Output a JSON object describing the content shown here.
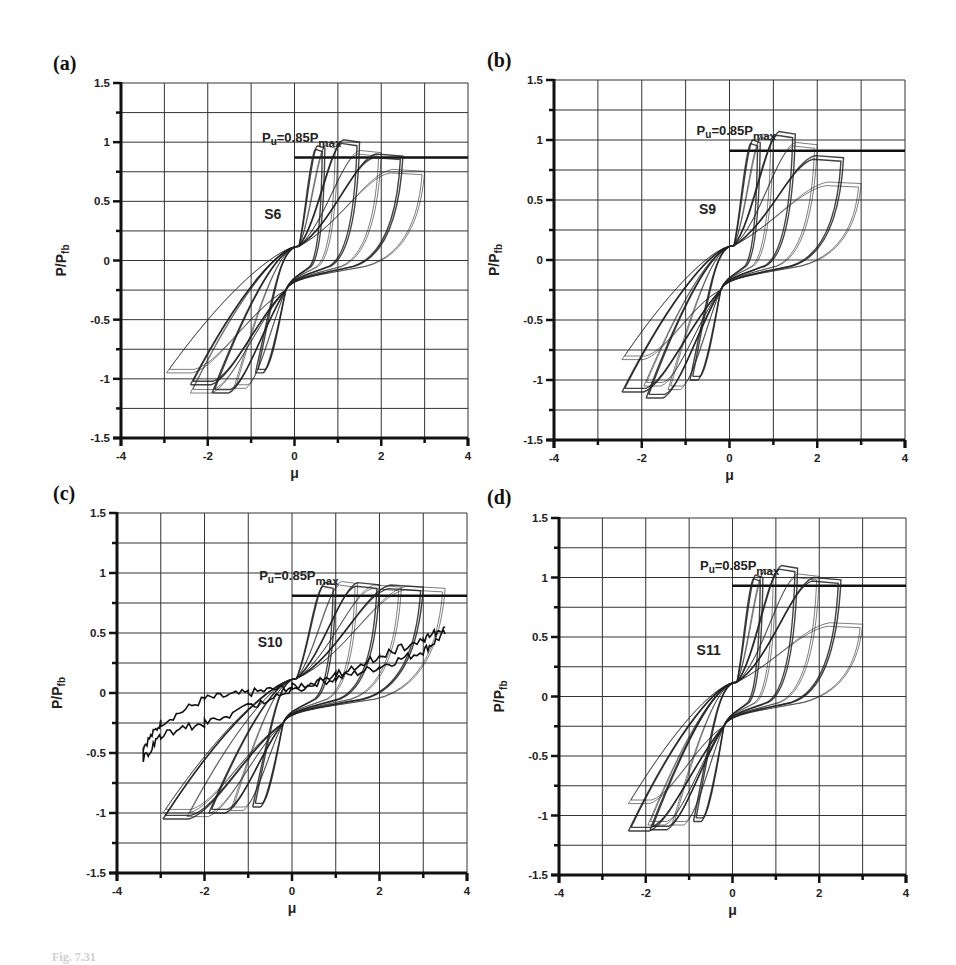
{
  "figure": {
    "caption_fragment": "Fig. 7.31",
    "background": "#ffffff",
    "line_color": "#222222"
  },
  "panels": [
    {
      "letter": "(a)",
      "specimen": "S6",
      "ylabel": "P/Pfb",
      "xlabel": "μ",
      "threshold_label": "Pu=0.85Pmax"
    },
    {
      "letter": "(b)",
      "specimen": "S9",
      "ylabel": "P/Pfb",
      "xlabel": "μ",
      "threshold_label": "Pu=0.85Pmax"
    },
    {
      "letter": "(c)",
      "specimen": "S10",
      "ylabel": "P/Pfb",
      "xlabel": "μ",
      "threshold_label": "Pu=0.85Pmax"
    },
    {
      "letter": "(d)",
      "specimen": "S11",
      "ylabel": "P/Pfb",
      "xlabel": "μ",
      "threshold_label": "Pu=0.85Pmax"
    }
  ],
  "chart_data": [
    {
      "type": "line",
      "title": "(a) S6",
      "xlabel": "μ",
      "ylabel": "P/Pfb",
      "xlim": [
        -4,
        4
      ],
      "ylim": [
        -1.5,
        1.5
      ],
      "x_ticks": [
        -4,
        -2,
        0,
        2,
        4
      ],
      "y_ticks": [
        -1.5,
        -1,
        -0.5,
        0,
        0.5,
        1,
        1.5
      ],
      "grid": true,
      "frame_px": {
        "left": 121,
        "top": 83,
        "right": 468,
        "bottom": 438
      },
      "annotations": [
        {
          "text": "Pu=0.85Pmax",
          "type": "threshold_line",
          "y": 0.87,
          "x_from": 0,
          "x_to": 4
        },
        {
          "text": "S6",
          "x": -0.5,
          "y": 0.35
        }
      ],
      "series": [
        {
          "name": "hysteresis loops",
          "cycles": [
            {
              "mu_pos": 0.7,
              "p_pos": 0.97,
              "mu_neg": -0.9,
              "p_neg": -0.95
            },
            {
              "mu_pos": 1.0,
              "p_pos": 1.0,
              "mu_neg": -1.4,
              "p_neg": -1.08
            },
            {
              "mu_pos": 1.5,
              "p_pos": 1.02,
              "mu_neg": -1.9,
              "p_neg": -1.12
            },
            {
              "mu_pos": 2.0,
              "p_pos": 0.93,
              "mu_neg": -2.4,
              "p_neg": -1.12
            },
            {
              "mu_pos": 2.5,
              "p_pos": 0.9,
              "mu_neg": -2.4,
              "p_neg": -1.05
            },
            {
              "mu_pos": 3.0,
              "p_pos": 0.77,
              "mu_neg": -2.95,
              "p_neg": -0.95
            }
          ]
        }
      ]
    },
    {
      "type": "line",
      "title": "(b) S9",
      "xlabel": "μ",
      "ylabel": "P/Pfb",
      "xlim": [
        -4,
        4
      ],
      "ylim": [
        -1.5,
        1.5
      ],
      "x_ticks": [
        -4,
        -2,
        0,
        2,
        4
      ],
      "y_ticks": [
        -1.5,
        -1,
        -0.5,
        0,
        0.5,
        1,
        1.5
      ],
      "grid": true,
      "frame_px": {
        "left": 554,
        "top": 80,
        "right": 905,
        "bottom": 440
      },
      "annotations": [
        {
          "text": "Pu=0.85Pmax",
          "type": "threshold_line",
          "y": 0.91,
          "x_from": 0,
          "x_to": 4
        },
        {
          "text": "S9",
          "x": -0.5,
          "y": 0.38
        }
      ],
      "series": [
        {
          "name": "hysteresis loops",
          "cycles": [
            {
              "mu_pos": 0.7,
              "p_pos": 1.0,
              "mu_neg": -0.9,
              "p_neg": -1.0
            },
            {
              "mu_pos": 1.0,
              "p_pos": 1.05,
              "mu_neg": -1.4,
              "p_neg": -1.08
            },
            {
              "mu_pos": 1.5,
              "p_pos": 1.07,
              "mu_neg": -1.9,
              "p_neg": -1.15
            },
            {
              "mu_pos": 2.0,
              "p_pos": 0.98,
              "mu_neg": -1.95,
              "p_neg": -1.05
            },
            {
              "mu_pos": 2.6,
              "p_pos": 0.87,
              "mu_neg": -2.45,
              "p_neg": -1.1
            },
            {
              "mu_pos": 3.0,
              "p_pos": 0.65,
              "mu_neg": -2.45,
              "p_neg": -0.83
            }
          ]
        }
      ]
    },
    {
      "type": "line",
      "title": "(c) S10",
      "xlabel": "μ",
      "ylabel": "P/Pfb",
      "xlim": [
        -4,
        4
      ],
      "ylim": [
        -1.5,
        1.5
      ],
      "x_ticks": [
        -4,
        -2,
        0,
        2,
        4
      ],
      "y_ticks": [
        -1.5,
        -1,
        -0.5,
        0,
        0.5,
        1,
        1.5
      ],
      "grid": true,
      "frame_px": {
        "left": 117,
        "top": 513,
        "right": 467,
        "bottom": 873
      },
      "annotations": [
        {
          "text": "Pu=0.85Pmax",
          "type": "threshold_line",
          "y": 0.81,
          "x_from": 0,
          "x_to": 4
        },
        {
          "text": "S10",
          "x": -0.5,
          "y": 0.38
        }
      ],
      "series": [
        {
          "name": "hysteresis loops",
          "cycles": [
            {
              "mu_pos": 1.0,
              "p_pos": 0.92,
              "mu_neg": -0.9,
              "p_neg": -0.95
            },
            {
              "mu_pos": 1.5,
              "p_pos": 0.93,
              "mu_neg": -1.4,
              "p_neg": -0.98
            },
            {
              "mu_pos": 2.0,
              "p_pos": 0.92,
              "mu_neg": -1.9,
              "p_neg": -1.0
            },
            {
              "mu_pos": 2.5,
              "p_pos": 0.9,
              "mu_neg": -2.4,
              "p_neg": -1.03
            },
            {
              "mu_pos": 3.0,
              "p_pos": 0.9,
              "mu_neg": -2.95,
              "p_neg": -1.05
            },
            {
              "mu_pos": 3.5,
              "p_pos": 0.89,
              "mu_neg": -2.95,
              "p_neg": -1.0
            }
          ]
        },
        {
          "name": "final degraded cycle (noisy)",
          "points": [
            [
              3.5,
              0.55
            ],
            [
              3.0,
              0.45
            ],
            [
              2.0,
              0.3
            ],
            [
              1.0,
              0.15
            ],
            [
              0.0,
              0.02
            ],
            [
              -1.0,
              -0.12
            ],
            [
              -2.0,
              -0.25
            ],
            [
              -3.0,
              -0.35
            ],
            [
              -3.4,
              -0.55
            ],
            [
              -3.4,
              -0.45
            ],
            [
              -3.0,
              -0.25
            ],
            [
              -2.0,
              -0.05
            ],
            [
              -1.0,
              0.0
            ],
            [
              0.0,
              0.05
            ],
            [
              1.0,
              0.12
            ],
            [
              2.0,
              0.22
            ],
            [
              3.0,
              0.35
            ],
            [
              3.5,
              0.5
            ]
          ]
        }
      ]
    },
    {
      "type": "line",
      "title": "(d) S11",
      "xlabel": "μ",
      "ylabel": "P/Pfb",
      "xlim": [
        -4,
        4
      ],
      "ylim": [
        -1.5,
        1.5
      ],
      "x_ticks": [
        -4,
        -2,
        0,
        2,
        4
      ],
      "y_ticks": [
        -1.5,
        -1,
        -0.5,
        0,
        0.5,
        1,
        1.5
      ],
      "grid": true,
      "frame_px": {
        "left": 559,
        "top": 518,
        "right": 906,
        "bottom": 875
      },
      "annotations": [
        {
          "text": "Pu=0.85Pmax",
          "type": "threshold_line",
          "y": 0.93,
          "x_from": 0,
          "x_to": 4
        },
        {
          "text": "S11",
          "x": -0.55,
          "y": 0.35
        }
      ],
      "series": [
        {
          "name": "hysteresis loops",
          "cycles": [
            {
              "mu_pos": 0.7,
              "p_pos": 1.02,
              "mu_neg": -0.9,
              "p_neg": -1.05
            },
            {
              "mu_pos": 1.0,
              "p_pos": 1.07,
              "mu_neg": -1.4,
              "p_neg": -1.08
            },
            {
              "mu_pos": 1.5,
              "p_pos": 1.1,
              "mu_neg": -1.9,
              "p_neg": -1.12
            },
            {
              "mu_pos": 2.0,
              "p_pos": 1.03,
              "mu_neg": -1.95,
              "p_neg": -1.08
            },
            {
              "mu_pos": 2.5,
              "p_pos": 1.0,
              "mu_neg": -2.4,
              "p_neg": -1.13
            },
            {
              "mu_pos": 3.0,
              "p_pos": 0.62,
              "mu_neg": -2.4,
              "p_neg": -0.9
            }
          ]
        }
      ]
    }
  ]
}
